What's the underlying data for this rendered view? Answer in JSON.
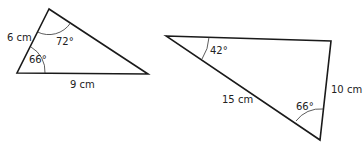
{
  "figure": {
    "triangles": [
      {
        "id": "triangle-1",
        "vertices": [
          [
            49,
            9
          ],
          [
            17,
            73
          ],
          [
            148,
            74
          ]
        ],
        "side_labels": [
          {
            "text": "6 cm",
            "x": 7,
            "y": 41
          },
          {
            "text": "9 cm",
            "x": 70,
            "y": 88
          }
        ],
        "angle_labels": [
          {
            "text": "72°",
            "x": 56,
            "y": 45
          },
          {
            "text": "66°",
            "x": 29,
            "y": 63
          }
        ]
      },
      {
        "id": "triangle-2",
        "vertices": [
          [
            166,
            36
          ],
          [
            331,
            41
          ],
          [
            320,
            140
          ]
        ],
        "side_labels": [
          {
            "text": "15 cm",
            "x": 222,
            "y": 103
          },
          {
            "text": "10 cm",
            "x": 331,
            "y": 93
          }
        ],
        "angle_labels": [
          {
            "text": "42°",
            "x": 210,
            "y": 54
          },
          {
            "text": "66°",
            "x": 296,
            "y": 110
          }
        ]
      }
    ]
  }
}
